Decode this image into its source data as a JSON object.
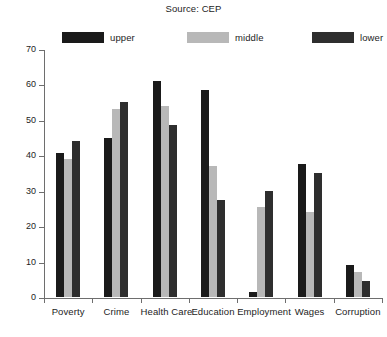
{
  "chart_data": {
    "type": "bar",
    "title": "Source: CEP",
    "xlabel": "",
    "ylabel": "",
    "ylim": [
      0,
      70
    ],
    "yticks": [
      0,
      10,
      20,
      30,
      40,
      50,
      60,
      70
    ],
    "grid": false,
    "legend_position": "top",
    "categories": [
      "Poverty",
      "Crime",
      "Health Care",
      "Education",
      "Employment",
      "Wages",
      "Corruption"
    ],
    "series": [
      {
        "name": "upper",
        "color": "#1a1a1a",
        "values": [
          40.7,
          45.0,
          61.0,
          58.5,
          1.5,
          37.5,
          9.0
        ]
      },
      {
        "name": "middle",
        "color": "#b8b8b8",
        "values": [
          39.0,
          53.0,
          54.0,
          37.0,
          25.5,
          24.0,
          7.0
        ]
      },
      {
        "name": "lower",
        "color": "#2e2e2e",
        "values": [
          44.0,
          55.0,
          48.5,
          27.5,
          30.0,
          35.0,
          4.5
        ]
      }
    ]
  },
  "axis": {
    "y_tick_labels": [
      "0",
      "10",
      "20",
      "30",
      "40",
      "50",
      "60",
      "70"
    ]
  }
}
